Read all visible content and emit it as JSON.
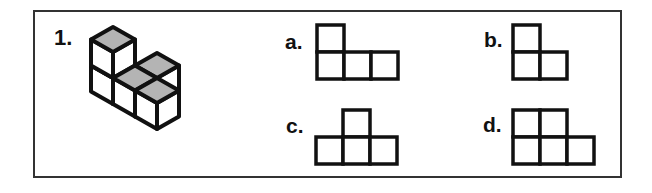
{
  "question": {
    "number": "1.",
    "figure": {
      "description": "isometric cube arrangement",
      "cubes": [
        [
          0,
          2,
          0
        ],
        [
          0,
          2,
          1
        ],
        [
          0,
          1,
          0
        ],
        [
          1,
          1,
          0
        ],
        [
          0,
          0,
          0
        ]
      ],
      "top_face_color": "#b4b4b4",
      "side_face_color": "#ffffff",
      "line_color": "#111111"
    }
  },
  "options": [
    {
      "label": "a.",
      "cells": [
        [
          0,
          0
        ],
        [
          0,
          1
        ],
        [
          1,
          1
        ],
        [
          2,
          1
        ]
      ]
    },
    {
      "label": "b.",
      "cells": [
        [
          0,
          0
        ],
        [
          0,
          1
        ],
        [
          1,
          1
        ]
      ]
    },
    {
      "label": "c.",
      "cells": [
        [
          1,
          0
        ],
        [
          0,
          1
        ],
        [
          1,
          1
        ],
        [
          2,
          1
        ]
      ]
    },
    {
      "label": "d.",
      "cells": [
        [
          0,
          0
        ],
        [
          1,
          0
        ],
        [
          0,
          1
        ],
        [
          1,
          1
        ],
        [
          2,
          1
        ]
      ]
    }
  ]
}
